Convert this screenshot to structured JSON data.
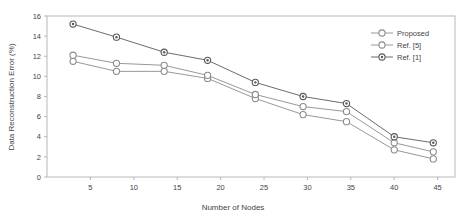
{
  "chart_data": {
    "type": "line",
    "title": "",
    "xlabel": "Number of Nodes",
    "ylabel": "Data Reconstruction Error (%)",
    "xlim": [
      0,
      47
    ],
    "ylim": [
      0,
      16
    ],
    "xticks": [
      5,
      10,
      15,
      20,
      25,
      30,
      35,
      40,
      45
    ],
    "yticks": [
      0,
      2,
      4,
      6,
      8,
      10,
      12,
      14,
      16
    ],
    "grid": false,
    "legend_position": "top-right",
    "x": [
      3,
      8,
      13.5,
      18.5,
      24,
      29.5,
      34.5,
      40,
      44.5
    ],
    "series": [
      {
        "name": "Proposed",
        "marker": "open-circle",
        "color": "#8c8c8c",
        "values": [
          11.5,
          10.5,
          10.5,
          9.8,
          7.8,
          6.2,
          5.5,
          2.7,
          1.8
        ]
      },
      {
        "name": "Ref. [5]",
        "marker": "open-circle",
        "color": "#8c8c8c",
        "values": [
          12.1,
          11.3,
          11.1,
          10.1,
          8.2,
          7.0,
          6.5,
          3.4,
          2.5
        ]
      },
      {
        "name": "Ref. [1]",
        "marker": "filled-circle",
        "color": "#595959",
        "values": [
          15.2,
          13.9,
          12.4,
          11.6,
          9.4,
          8.0,
          7.3,
          4.0,
          3.4
        ]
      }
    ]
  },
  "legend": {
    "entries": [
      {
        "label": "Proposed"
      },
      {
        "label": "Ref. [5]"
      },
      {
        "label": "Ref. [1]"
      }
    ]
  },
  "axes": {
    "x_tick_labels": [
      "5",
      "10",
      "15",
      "20",
      "25",
      "30",
      "35",
      "40",
      "45"
    ],
    "y_tick_labels": [
      "0",
      "2",
      "4",
      "6",
      "8",
      "10",
      "12",
      "14",
      "16"
    ],
    "x_title": "Number of Nodes",
    "y_title": "Data Reconstruction Error (%)"
  },
  "colors": {
    "plot_border": "#b8b8b8",
    "series_light": "#8c8c8c",
    "series_dark": "#595959",
    "text": "#444444",
    "background": "#ffffff"
  }
}
